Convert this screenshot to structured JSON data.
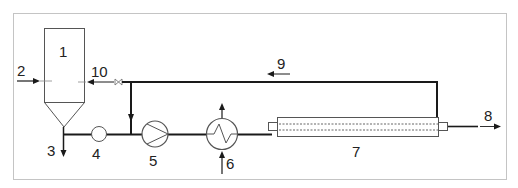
{
  "diagram": {
    "type": "process-flow",
    "colors": {
      "line": "#1a1a1a",
      "frame": "#bdbdbd",
      "equipment": "#555555"
    },
    "labels": [
      {
        "id": "1",
        "text": "1",
        "meaning": "tank"
      },
      {
        "id": "2",
        "text": "2",
        "meaning": "feed inlet"
      },
      {
        "id": "3",
        "text": "3",
        "meaning": "bottom outlet"
      },
      {
        "id": "4",
        "text": "4",
        "meaning": "flow meter"
      },
      {
        "id": "5",
        "text": "5",
        "meaning": "pump"
      },
      {
        "id": "6",
        "text": "6",
        "meaning": "heat exchanger"
      },
      {
        "id": "7",
        "text": "7",
        "meaning": "membrane module"
      },
      {
        "id": "8",
        "text": "8",
        "meaning": "permeate outlet"
      },
      {
        "id": "9",
        "text": "9",
        "meaning": "retentate recycle"
      },
      {
        "id": "10",
        "text": "10",
        "meaning": "return to tank via valve"
      }
    ]
  }
}
